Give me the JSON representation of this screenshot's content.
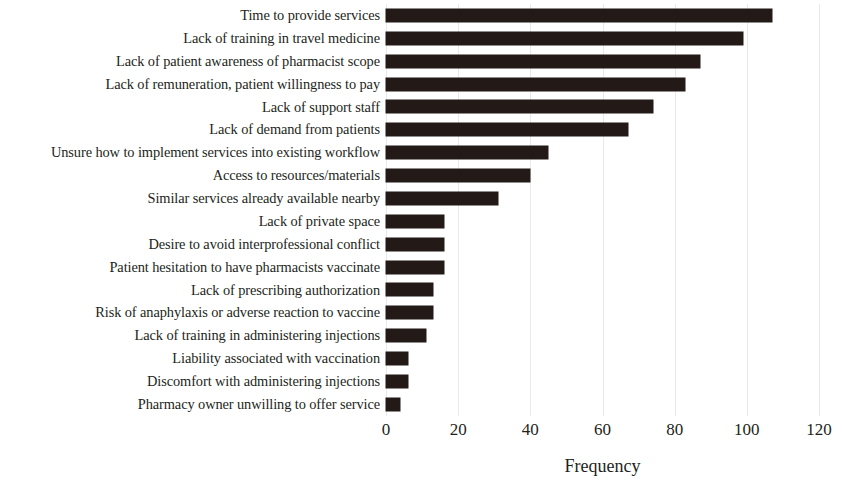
{
  "chart_data": {
    "type": "bar",
    "orientation": "horizontal",
    "title": "",
    "xlabel": "Frequency",
    "ylabel": "",
    "xlim": [
      0,
      120
    ],
    "xticks": [
      0,
      20,
      40,
      60,
      80,
      100,
      120
    ],
    "xtick_labels": [
      "0",
      "20",
      "40",
      "60",
      "80",
      "100",
      "120"
    ],
    "grid": true,
    "grid_axis": "x",
    "legend": null,
    "bar_color": "#231a18",
    "categories": [
      "Time to provide services",
      "Lack of training in travel medicine",
      "Lack of patient awareness of pharmacist scope",
      "Lack of remuneration, patient willingness to pay",
      "Lack of support staff",
      "Lack of demand from patients",
      "Unsure how to implement services into existing workflow",
      "Access to resources/materials",
      "Similar services already available nearby",
      "Lack of private space",
      "Desire to avoid interprofessional conflict",
      "Patient hesitation to have pharmacists vaccinate",
      "Lack of prescribing authorization",
      "Risk of anaphylaxis or adverse reaction to vaccine",
      "Lack of training in administering injections",
      "Liability associated with vaccination",
      "Discomfort with administering injections",
      "Pharmacy owner unwilling to offer service"
    ],
    "values": [
      107,
      99,
      87,
      83,
      74,
      67,
      45,
      40,
      31,
      16,
      16,
      16,
      13,
      13,
      11,
      6,
      6,
      4
    ]
  }
}
